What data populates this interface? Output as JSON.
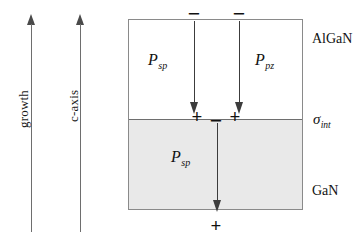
{
  "figure": {
    "background_color": "#ffffff"
  },
  "axes": [
    {
      "id": "growth",
      "label": "growth",
      "direction": "up",
      "color": "#6e6e6e"
    },
    {
      "id": "c-axis",
      "label": "c-axis",
      "direction": "up",
      "color": "#6e6e6e"
    }
  ],
  "stack": {
    "border_color": "#8a8a8a",
    "layers": [
      {
        "id": "algan",
        "label": "AlGaN",
        "fill": "#ffffff"
      },
      {
        "id": "gan",
        "label": "GaN",
        "fill": "#e9e9e9"
      }
    ],
    "interface": {
      "label_base": "σ",
      "label_sub": "int",
      "line_color": "#6e6e6e"
    }
  },
  "polarization_vectors": [
    {
      "id": "algan-psp",
      "base": "P",
      "sub": "sp",
      "layer": "algan",
      "direction": "down"
    },
    {
      "id": "algan-ppz",
      "base": "P",
      "sub": "pz",
      "layer": "algan",
      "direction": "down"
    },
    {
      "id": "gan-psp",
      "base": "P",
      "sub": "sp",
      "layer": "gan",
      "direction": "down"
    }
  ],
  "charges": [
    {
      "id": "top-sheet-left",
      "sign": "−",
      "location": "algan-top-surface-left"
    },
    {
      "id": "top-sheet-right",
      "sign": "−",
      "location": "algan-top-surface-right"
    },
    {
      "id": "interface-plus-left",
      "sign": "+",
      "location": "interface-left"
    },
    {
      "id": "interface-minus-mid",
      "sign": "−",
      "location": "interface-middle"
    },
    {
      "id": "interface-plus-right",
      "sign": "+",
      "location": "interface-right"
    },
    {
      "id": "bottom-sheet",
      "sign": "+",
      "location": "gan-bottom-surface"
    }
  ]
}
